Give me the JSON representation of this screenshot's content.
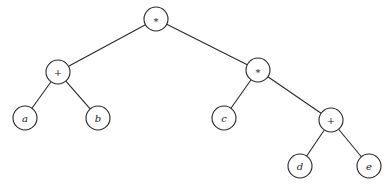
{
  "diagram": {
    "type": "expression-tree",
    "nodes": [
      {
        "id": "root",
        "label": "*",
        "kind": "op",
        "x": 156,
        "y": 19
      },
      {
        "id": "plus1",
        "label": "+",
        "kind": "op",
        "x": 58,
        "y": 72
      },
      {
        "id": "mul2",
        "label": "*",
        "kind": "op",
        "x": 258,
        "y": 70
      },
      {
        "id": "a",
        "label": "a",
        "kind": "var",
        "x": 25,
        "y": 118
      },
      {
        "id": "b",
        "label": "b",
        "kind": "var",
        "x": 98,
        "y": 118
      },
      {
        "id": "c",
        "label": "c",
        "kind": "var",
        "x": 224,
        "y": 118
      },
      {
        "id": "plus2",
        "label": "+",
        "kind": "op",
        "x": 331,
        "y": 120
      },
      {
        "id": "d",
        "label": "d",
        "kind": "var",
        "x": 300,
        "y": 166
      },
      {
        "id": "e",
        "label": "e",
        "kind": "var",
        "x": 369,
        "y": 166
      }
    ],
    "edges": [
      [
        "root",
        "plus1"
      ],
      [
        "root",
        "mul2"
      ],
      [
        "plus1",
        "a"
      ],
      [
        "plus1",
        "b"
      ],
      [
        "mul2",
        "c"
      ],
      [
        "mul2",
        "plus2"
      ],
      [
        "plus2",
        "d"
      ],
      [
        "plus2",
        "e"
      ]
    ],
    "node_radius": 12
  }
}
